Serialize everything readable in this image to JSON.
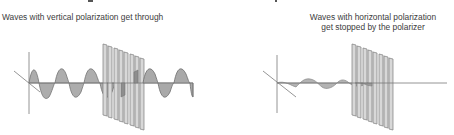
{
  "panels": [
    {
      "id": "vertical",
      "caption": "Waves with vertical polarization get through",
      "outcome": "transmitted"
    },
    {
      "id": "horizontal",
      "caption_lines": [
        "Waves with horizontal polarization",
        "get stopped by the polarizer"
      ],
      "outcome": "blocked"
    }
  ],
  "colors": {
    "wave_fill": "#a9a9a9",
    "wave_stroke": "#6e6e6e",
    "axis": "#7a7a7a",
    "polarizer_fill": "#d4d4d4",
    "polarizer_stroke": "#7c7c7c",
    "text": "#3c3c3c"
  },
  "polarizer": {
    "slat_count": 8
  }
}
